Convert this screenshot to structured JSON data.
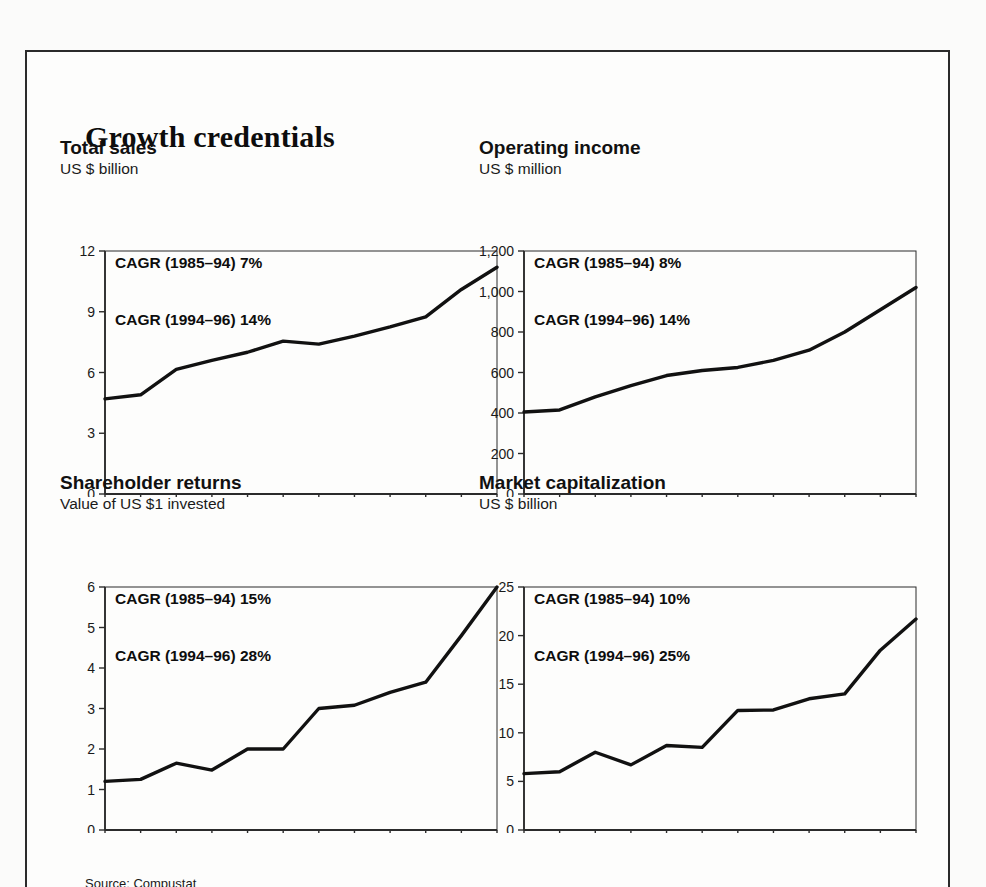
{
  "exhibit": {
    "title": "Growth credentials",
    "source": "Source: Compustat"
  },
  "panels": [
    {
      "id": "total-sales",
      "title": "Total sales",
      "subtitle": "US $ billion",
      "cagr_1": "CAGR (1985–94) 7%",
      "cagr_2": "CAGR (1994–96) 14%"
    },
    {
      "id": "operating-income",
      "title": "Operating income",
      "subtitle": "US $ million",
      "cagr_1": "CAGR (1985–94) 8%",
      "cagr_2": "CAGR (1994–96) 14%"
    },
    {
      "id": "shareholder-returns",
      "title": "Shareholder returns",
      "subtitle": "Value of US $1 invested",
      "cagr_1": "CAGR (1985–94) 15%",
      "cagr_2": "CAGR (1994–96) 28%"
    },
    {
      "id": "market-capitalization",
      "title": "Market capitalization",
      "subtitle": "US $ billion",
      "cagr_1": "CAGR (1985–94) 10%",
      "cagr_2": "CAGR (1994–96) 25%"
    }
  ],
  "chart_data": [
    {
      "type": "line",
      "title": "Total sales",
      "subtitle": "US $ billion",
      "xlabel": "",
      "ylabel": "US $ billion",
      "x": [
        1985,
        1986,
        1987,
        1988,
        1989,
        1990,
        1991,
        1992,
        1993,
        1994,
        1995,
        1996
      ],
      "values": [
        4.7,
        4.9,
        6.15,
        6.6,
        7.0,
        7.55,
        7.4,
        7.8,
        8.25,
        8.75,
        10.1,
        11.2
      ],
      "xlim": [
        1985,
        1996
      ],
      "ylim": [
        0,
        12
      ],
      "yticks": [
        0,
        3,
        6,
        9,
        12
      ],
      "ytick_labels": [
        "0",
        "3",
        "6",
        "9",
        "12"
      ],
      "xticks": [
        1985,
        1986,
        1987,
        1988,
        1989,
        1990,
        1991,
        1992,
        1993,
        1994,
        1995,
        1996
      ],
      "xtick_labels": [
        "",
        "1986",
        "",
        "1988",
        "",
        "1990",
        "",
        "1992",
        "",
        "1994",
        "",
        "1996"
      ],
      "grid": false,
      "legend": "none",
      "annotations": [
        "CAGR (1985–94) 7%",
        "CAGR (1994–96) 14%"
      ]
    },
    {
      "type": "line",
      "title": "Operating income",
      "subtitle": "US $ million",
      "xlabel": "",
      "ylabel": "US $ million",
      "x": [
        1985,
        1986,
        1987,
        1988,
        1989,
        1990,
        1991,
        1992,
        1993,
        1994,
        1995,
        1996
      ],
      "values": [
        405,
        415,
        480,
        535,
        585,
        610,
        625,
        660,
        710,
        800,
        910,
        1020
      ],
      "xlim": [
        1985,
        1996
      ],
      "ylim": [
        0,
        1200
      ],
      "yticks": [
        0,
        200,
        400,
        600,
        800,
        1000,
        1200
      ],
      "ytick_labels": [
        "0",
        "200",
        "400",
        "600",
        "800",
        "1,000",
        "1,200"
      ],
      "xticks": [
        1985,
        1986,
        1987,
        1988,
        1989,
        1990,
        1991,
        1992,
        1993,
        1994,
        1995,
        1996
      ],
      "xtick_labels": [
        "",
        "1986",
        "",
        "1988",
        "",
        "1990",
        "",
        "1992",
        "",
        "1994",
        "",
        "1996"
      ],
      "grid": false,
      "legend": "none",
      "annotations": [
        "CAGR (1985–94) 8%",
        "CAGR (1994–96) 14%"
      ]
    },
    {
      "type": "line",
      "title": "Shareholder returns",
      "subtitle": "Value of US $1 invested",
      "xlabel": "",
      "ylabel": "Value of US $1 invested",
      "x": [
        1985,
        1986,
        1987,
        1988,
        1989,
        1990,
        1991,
        1992,
        1993,
        1994,
        1995,
        1996
      ],
      "values": [
        1.2,
        1.25,
        1.65,
        1.48,
        2.0,
        2.0,
        3.0,
        3.08,
        3.4,
        3.65,
        4.8,
        6.0
      ],
      "xlim": [
        1985,
        1996
      ],
      "ylim": [
        0,
        6
      ],
      "yticks": [
        0,
        1,
        2,
        3,
        4,
        5,
        6
      ],
      "ytick_labels": [
        "0",
        "1",
        "2",
        "3",
        "4",
        "5",
        "6"
      ],
      "xticks": [
        1985,
        1986,
        1987,
        1988,
        1989,
        1990,
        1991,
        1992,
        1993,
        1994,
        1995,
        1996
      ],
      "xtick_labels": [
        "",
        "1986",
        "",
        "1988",
        "",
        "1990",
        "",
        "1992",
        "",
        "1994",
        "",
        "1996"
      ],
      "grid": false,
      "legend": "none",
      "annotations": [
        "CAGR (1985–94) 15%",
        "CAGR (1994–96) 28%"
      ]
    },
    {
      "type": "line",
      "title": "Market capitalization",
      "subtitle": "US $ billion",
      "xlabel": "",
      "ylabel": "US $ billion",
      "x": [
        1985,
        1986,
        1987,
        1988,
        1989,
        1990,
        1991,
        1992,
        1993,
        1994,
        1995,
        1996
      ],
      "values": [
        5.8,
        6.0,
        8.0,
        6.7,
        8.7,
        8.5,
        12.3,
        12.35,
        13.5,
        14.0,
        18.5,
        21.7
      ],
      "xlim": [
        1985,
        1996
      ],
      "ylim": [
        0,
        25
      ],
      "yticks": [
        0,
        5,
        10,
        15,
        20,
        25
      ],
      "ytick_labels": [
        "0",
        "5",
        "10",
        "15",
        "20",
        "25"
      ],
      "xticks": [
        1985,
        1986,
        1987,
        1988,
        1989,
        1990,
        1991,
        1992,
        1993,
        1994,
        1995,
        1996
      ],
      "xtick_labels": [
        "",
        "1986",
        "",
        "1988",
        "",
        "1990",
        "",
        "1992",
        "",
        "1994",
        "",
        "1996"
      ],
      "grid": false,
      "legend": "none",
      "annotations": [
        "CAGR (1985–94) 10%",
        "CAGR (1994–96) 25%"
      ]
    }
  ],
  "style": {
    "line_color": "#111111",
    "axis_color": "#2b2b2b",
    "page_bg": "#fdfdfc",
    "text_color": "#111111"
  }
}
